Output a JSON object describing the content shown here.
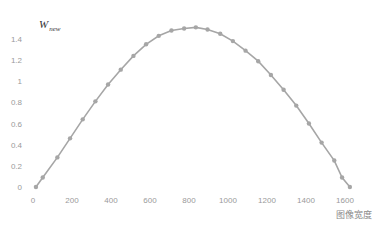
{
  "chart_data": {
    "type": "line",
    "title": "",
    "xlabel": "图像宽度",
    "ylabel": "W",
    "ylabel_subscript": "new",
    "xlim": [
      0,
      1700
    ],
    "ylim": [
      0,
      1.5
    ],
    "x_ticks": [
      0,
      200,
      400,
      600,
      800,
      1000,
      1200,
      1400,
      1600
    ],
    "y_ticks": [
      0,
      0.2,
      0.4,
      0.6,
      0.8,
      1,
      1.2,
      1.4
    ],
    "y_tick_labels": [
      "0",
      "0.2",
      "0.4",
      "0.6",
      "0.8",
      "1",
      "1.2",
      "1.4"
    ],
    "grid": false,
    "legend": null,
    "series": [
      {
        "name": "W_new",
        "color": "#a6a6a6",
        "marker": "circle",
        "x": [
          15,
          50,
          125,
          190,
          255,
          320,
          385,
          450,
          515,
          580,
          645,
          710,
          775,
          835,
          895,
          960,
          1025,
          1090,
          1155,
          1220,
          1285,
          1350,
          1415,
          1480,
          1545,
          1585,
          1625
        ],
        "y": [
          0.0,
          0.09,
          0.28,
          0.46,
          0.64,
          0.81,
          0.97,
          1.11,
          1.24,
          1.35,
          1.43,
          1.48,
          1.5,
          1.51,
          1.49,
          1.45,
          1.38,
          1.29,
          1.19,
          1.06,
          0.92,
          0.77,
          0.6,
          0.42,
          0.25,
          0.09,
          0.0
        ]
      }
    ]
  }
}
